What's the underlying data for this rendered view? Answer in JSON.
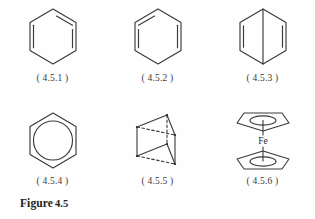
{
  "figure": {
    "caption_word": "Figure",
    "caption_number": "4.5",
    "line_color": "#3a3a3a",
    "background_color": "#fefefe"
  },
  "structures": [
    {
      "id": "4.5.1",
      "label": "( 4.5.1 )",
      "name": "kekule-benzene-a",
      "description": "hexagon with three alternating inner double-bond lines",
      "row": 1,
      "column": 1
    },
    {
      "id": "4.5.2",
      "label": "( 4.5.2 )",
      "name": "kekule-benzene-b",
      "description": "hexagon with three alternating inner double-bond lines, mirrored",
      "row": 1,
      "column": 2
    },
    {
      "id": "4.5.3",
      "label": "( 4.5.3 )",
      "name": "dewar-benzene",
      "description": "hexagon with vertical bridging bond and two side double bonds",
      "row": 1,
      "column": 3
    },
    {
      "id": "4.5.4",
      "label": "( 4.5.4 )",
      "name": "aromatic-circle-benzene",
      "description": "hexagon with inscribed circle",
      "row": 2,
      "column": 1
    },
    {
      "id": "4.5.5",
      "label": "( 4.5.5 )",
      "name": "prismane",
      "description": "triangular prism with dashed hidden edges",
      "row": 2,
      "column": 2
    },
    {
      "id": "4.5.6",
      "label": "( 4.5.6 )",
      "name": "ferrocene",
      "description": "two cyclopentadienyl rings with inscribed ellipses bonded to central iron atom",
      "row": 2,
      "column": 3,
      "metal_label": "Fe"
    }
  ]
}
